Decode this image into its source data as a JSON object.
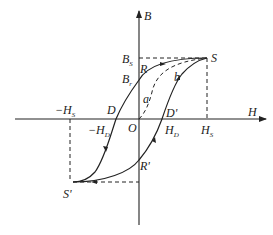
{
  "diagram": {
    "type": "hysteresis-loop",
    "axes": {
      "x_label": "H",
      "y_label": "B",
      "origin_label": "O"
    },
    "points": {
      "S": {
        "label": "S"
      },
      "S_prime": {
        "label": "S'"
      },
      "D": {
        "label": "D"
      },
      "D_prime": {
        "label": "D'"
      },
      "R": {
        "label": "R"
      },
      "R_prime": {
        "label": "R'"
      },
      "a": {
        "label": "a"
      },
      "b": {
        "label": "b"
      }
    },
    "ticks": {
      "Bs": {
        "main": "B",
        "sub": "S"
      },
      "Br": {
        "main": "B",
        "sub": "r"
      },
      "Hs": {
        "main": "H",
        "sub": "S"
      },
      "neg_Hs": {
        "main": "−H",
        "sub": "S"
      },
      "Hd": {
        "main": "H",
        "sub": "D"
      },
      "neg_Hd": {
        "main": "−H",
        "sub": "D"
      }
    },
    "colors": {
      "line": "#222222",
      "background": "#ffffff"
    }
  }
}
